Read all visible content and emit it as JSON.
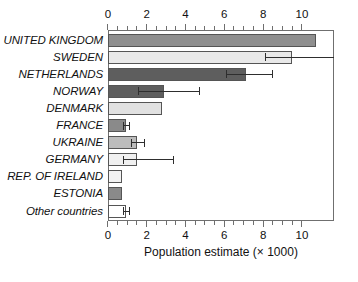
{
  "chart_data": {
    "type": "bar",
    "orientation": "horizontal",
    "title": "",
    "xlabel": "Population estimate (× 1000)",
    "ylabel": "",
    "xlim": [
      0,
      11.65
    ],
    "xticks": [
      0,
      2,
      4,
      6,
      8,
      10
    ],
    "xticklabels": [
      "0",
      "2",
      "4",
      "6",
      "8",
      "10"
    ],
    "minor_tick_step": 0.5,
    "grid": false,
    "legend": null,
    "axis_top": true,
    "axis_bottom": true,
    "categories": [
      "UNITED KINGDOM",
      "SWEDEN",
      "NETHERLANDS",
      "NORWAY",
      "DENMARK",
      "FRANCE",
      "UKRAINE",
      "GERMANY",
      "REP. OF IRELAND",
      "ESTONIA",
      "Other countries"
    ],
    "values": [
      10.7,
      9.5,
      7.1,
      2.9,
      2.8,
      0.95,
      1.5,
      1.5,
      0.7,
      0.7,
      0.95
    ],
    "error_low": [
      null,
      8.1,
      6.1,
      1.6,
      null,
      0.8,
      1.2,
      0.8,
      null,
      null,
      0.8
    ],
    "error_high": [
      null,
      11.65,
      8.5,
      4.7,
      null,
      1.1,
      1.9,
      3.4,
      null,
      null,
      1.1
    ],
    "bar_colors": [
      "#8f8f8f",
      "#e9e9e9",
      "#5e5e5e",
      "#5e5e5e",
      "#e1e1e1",
      "#8a8a8a",
      "#bcbcbc",
      "#f0f0f0",
      "#f2f2f2",
      "#8a8a8a",
      "#ffffff"
    ]
  }
}
